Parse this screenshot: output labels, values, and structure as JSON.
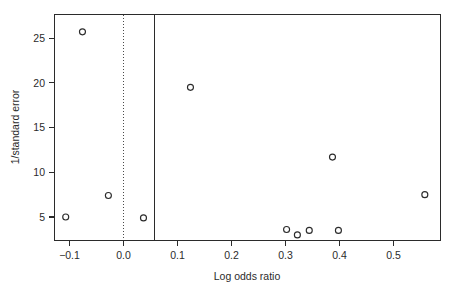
{
  "chart_data": {
    "type": "scatter",
    "title": "",
    "xlabel": "Log odds ratio",
    "ylabel": "1/standard error",
    "xlim": [
      -0.135,
      0.575
    ],
    "ylim": [
      1.9,
      27.0
    ],
    "grid": false,
    "legend": null,
    "x": [
      -0.107,
      -0.076,
      -0.028,
      0.037,
      0.124,
      0.302,
      0.322,
      0.344,
      0.387,
      0.398,
      0.558
    ],
    "y": [
      5.0,
      25.7,
      7.4,
      4.9,
      19.5,
      3.6,
      3.0,
      3.5,
      11.7,
      3.5,
      7.5
    ],
    "points": [
      {
        "x": -0.107,
        "y": 5.0
      },
      {
        "x": -0.076,
        "y": 25.7
      },
      {
        "x": -0.028,
        "y": 7.4
      },
      {
        "x": 0.037,
        "y": 4.9
      },
      {
        "x": 0.124,
        "y": 19.5
      },
      {
        "x": 0.302,
        "y": 3.6
      },
      {
        "x": 0.322,
        "y": 3.0
      },
      {
        "x": 0.344,
        "y": 3.5
      },
      {
        "x": 0.387,
        "y": 11.7
      },
      {
        "x": 0.398,
        "y": 3.5
      },
      {
        "x": 0.558,
        "y": 7.5
      }
    ],
    "xticks": [
      -0.1,
      0.0,
      0.1,
      0.2,
      0.3,
      0.4,
      0.5
    ],
    "xticklabels": [
      "−0.1",
      "0.0",
      "0.1",
      "0.2",
      "0.3",
      "0.4",
      "0.5"
    ],
    "yticks": [
      5,
      10,
      15,
      20,
      25
    ],
    "yticklabels": [
      "5",
      "10",
      "15",
      "20",
      "25"
    ],
    "reference_lines": [
      {
        "name": "null-effect-line",
        "x": 0.0,
        "style": "dotted"
      },
      {
        "name": "summary-effect-line",
        "x": 0.057,
        "style": "solid"
      }
    ],
    "marker": {
      "shape": "circle",
      "filled": false,
      "color": "#2b2b2b",
      "radius": 3.0
    }
  },
  "axes": {
    "x_title": "Log odds ratio",
    "y_title": "1/standard error"
  }
}
